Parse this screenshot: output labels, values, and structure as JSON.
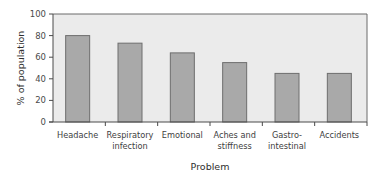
{
  "chart_data": {
    "type": "bar",
    "title": "",
    "xlabel": "Problem",
    "ylabel": "% of population",
    "ylim": [
      0,
      100
    ],
    "yticks": [
      0,
      20,
      40,
      60,
      80,
      100
    ],
    "grid": false,
    "legend": null,
    "categories": [
      [
        "Headache"
      ],
      [
        "Respiratory",
        "infection"
      ],
      [
        "Emotional"
      ],
      [
        "Aches and",
        "stiffness"
      ],
      [
        "Gastro-",
        "intestinal"
      ],
      [
        "Accidents"
      ]
    ],
    "category_names": [
      "Headache",
      "Respiratory infection",
      "Emotional",
      "Aches and stiffness",
      "Gastro-intestinal",
      "Accidents"
    ],
    "values": [
      80,
      73,
      64,
      55,
      45,
      45
    ]
  },
  "colors": {
    "bar_fill": "#a9a9a9",
    "bar_stroke": "#6e6e6e",
    "plot_background": "#ebebeb",
    "axis": "#4a4a4a"
  }
}
